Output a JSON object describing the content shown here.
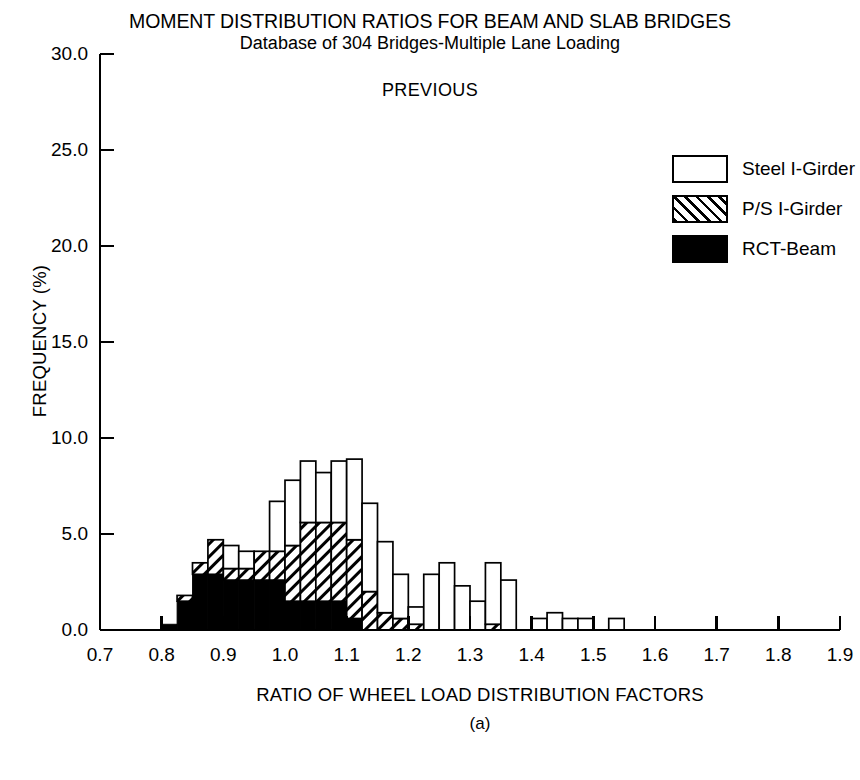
{
  "title": {
    "main": "MOMENT DISTRIBUTION RATIOS FOR BEAM AND SLAB BRIDGES",
    "sub": "Database of 304 Bridges-Multiple Lane Loading",
    "annotation": "PREVIOUS"
  },
  "axes": {
    "xlabel": "RATIO OF WHEEL LOAD DISTRIBUTION FACTORS",
    "ylabel": "FREQUENCY (%)",
    "panel_label": "(a)",
    "xticks": [
      "0.7",
      "0.8",
      "0.9",
      "1.0",
      "1.1",
      "1.2",
      "1.3",
      "1.4",
      "1.5",
      "1.6",
      "1.7",
      "1.8",
      "1.9"
    ],
    "yticks": [
      "0.0",
      "5.0",
      "10.0",
      "15.0",
      "20.0",
      "25.0",
      "30.0"
    ]
  },
  "legend": {
    "items": [
      {
        "label": "Steel I-Girder",
        "fill": "empty"
      },
      {
        "label": "P/S I-Girder",
        "fill": "hatch"
      },
      {
        "label": "RCT-Beam",
        "fill": "solid"
      }
    ]
  },
  "colors": {
    "ink": "#000000",
    "paper": "#ffffff"
  },
  "chart_data": {
    "type": "bar",
    "title": "MOMENT DISTRIBUTION RATIOS FOR BEAM AND SLAB BRIDGES",
    "subtitle": "Database of 304 Bridges-Multiple Lane Loading",
    "annotation": "PREVIOUS",
    "xlabel": "RATIO OF WHEEL LOAD DISTRIBUTION FACTORS",
    "ylabel": "FREQUENCY (%)",
    "xlim": [
      0.7,
      1.9
    ],
    "ylim": [
      0.0,
      30.0
    ],
    "bin_width": 0.025,
    "grid": false,
    "legend_position": "top-right",
    "stacked": true,
    "stack_order": [
      "RCT-Beam",
      "P/S I-Girder",
      "Steel I-Girder"
    ],
    "bin_starts": [
      0.8,
      0.825,
      0.85,
      0.875,
      0.9,
      0.925,
      0.95,
      0.975,
      1.0,
      1.025,
      1.05,
      1.075,
      1.1,
      1.125,
      1.15,
      1.175,
      1.2,
      1.225,
      1.25,
      1.275,
      1.3,
      1.325,
      1.35,
      1.375,
      1.4,
      1.425,
      1.45,
      1.475,
      1.5,
      1.525,
      1.55,
      1.575
    ],
    "series": [
      {
        "name": "RCT-Beam",
        "fill": "solid",
        "values": [
          0.3,
          1.5,
          2.9,
          2.9,
          2.6,
          2.6,
          2.6,
          2.6,
          1.5,
          1.5,
          1.5,
          1.5,
          0.6,
          0.0,
          0.0,
          0.0,
          0.0,
          0.0,
          0.0,
          0.0,
          0.0,
          0.0,
          0.0,
          0.0,
          0.0,
          0.0,
          0.0,
          0.0,
          0.0,
          0.0,
          0.0,
          0.0
        ]
      },
      {
        "name": "P/S I-Girder",
        "fill": "hatch",
        "values": [
          0.0,
          0.3,
          0.6,
          1.8,
          0.6,
          0.6,
          1.5,
          1.5,
          2.9,
          4.1,
          4.1,
          4.1,
          4.1,
          2.0,
          0.9,
          0.6,
          0.3,
          0.0,
          0.0,
          0.0,
          0.0,
          0.3,
          0.0,
          0.0,
          0.0,
          0.0,
          0.0,
          0.0,
          0.0,
          0.0,
          0.0,
          0.0
        ]
      },
      {
        "name": "Steel I-Girder",
        "fill": "empty",
        "values": [
          0.0,
          0.0,
          0.0,
          0.0,
          1.2,
          0.9,
          0.0,
          2.6,
          3.4,
          3.2,
          2.6,
          3.2,
          4.2,
          4.6,
          3.7,
          2.3,
          0.9,
          2.9,
          3.5,
          2.3,
          1.5,
          3.2,
          2.6,
          0.0,
          0.6,
          0.9,
          0.6,
          0.6,
          0.0,
          0.6,
          0.0,
          0.0
        ]
      }
    ],
    "totals": [
      0.3,
      1.8,
      3.5,
      4.7,
      4.4,
      4.1,
      4.1,
      6.7,
      7.8,
      8.8,
      8.2,
      8.8,
      8.9,
      6.6,
      4.6,
      2.9,
      1.2,
      2.9,
      3.5,
      2.3,
      1.5,
      3.5,
      2.6,
      0.0,
      0.6,
      0.9,
      0.6,
      0.6,
      0.0,
      0.6,
      0.0,
      0.0
    ]
  }
}
